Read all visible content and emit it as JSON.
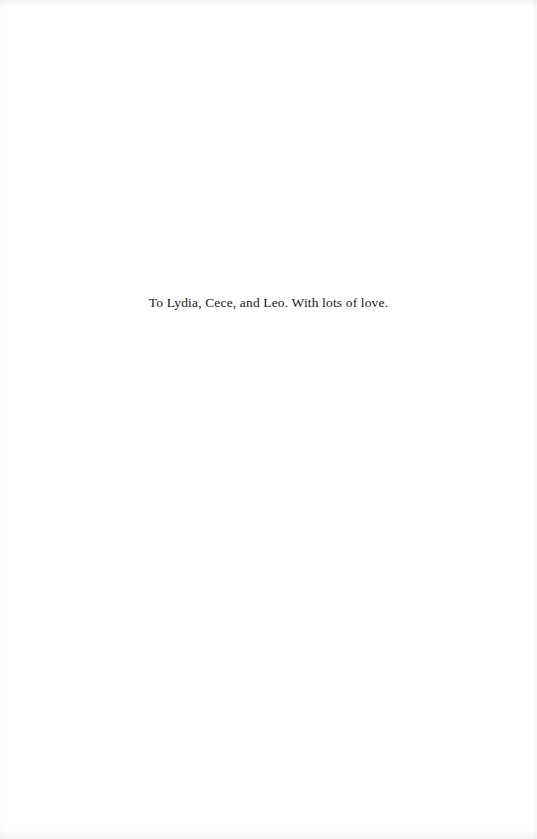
{
  "page": {
    "type": "dedication",
    "dedication_text": "To Lydia, Cece, and Leo. With lots of love."
  },
  "colors": {
    "background": "#ffffff",
    "text": "#1a1a1a"
  }
}
